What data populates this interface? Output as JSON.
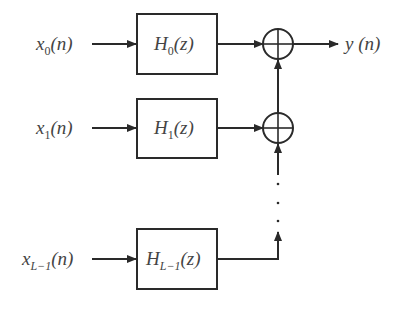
{
  "diagram": {
    "type": "parallel filter bank block diagram",
    "colors": {
      "stroke": "#2a2a2a",
      "text": "#444444",
      "background": "#ffffff"
    },
    "inputs": [
      {
        "sym": "x",
        "sub": "0",
        "arg": "(n)"
      },
      {
        "sym": "x",
        "sub": "1",
        "arg": "(n)"
      },
      {
        "sym": "x",
        "sub": "L−1",
        "arg": "(n)"
      }
    ],
    "filters": [
      {
        "sym": "H",
        "sub": "0",
        "arg": "(z)"
      },
      {
        "sym": "H",
        "sub": "1",
        "arg": "(z)"
      },
      {
        "sym": "H",
        "sub": "L−1",
        "arg": "(z)"
      }
    ],
    "adders": [
      {
        "symbol": "sum-junction"
      },
      {
        "symbol": "sum-junction"
      }
    ],
    "ellipsis": "⋮",
    "output": {
      "sym": "y",
      "arg": " (n)"
    }
  }
}
